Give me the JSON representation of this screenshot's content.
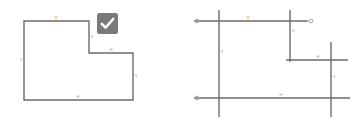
{
  "canvas": {
    "width": 361,
    "height": 124,
    "background": "#ffffff"
  },
  "colors": {
    "stroke": "#6b6b6b",
    "label_text": "#9a9a9a",
    "badge_correct_bg": "#7a7a7a",
    "badge_incorrect_bg": "#7a7a7a",
    "badge_glyph": "#ffffff",
    "endpoint_marker": "#a8a8a8"
  },
  "panels": [
    {
      "id": "correct",
      "name": "closed-polygon-example",
      "badge": {
        "icon": "check-icon",
        "label": "Correct",
        "background": "#7a7a7a"
      },
      "shape": {
        "type": "closed-polygon",
        "sides": 6,
        "points": "24,21 89,21 89,53 133,53 133,100 24,100",
        "edges": [
          {
            "id": "top",
            "label": "H",
            "orientation": "horizontal",
            "label_x": 56,
            "label_y": 19
          },
          {
            "id": "right-upper",
            "label": "V",
            "orientation": "vertical",
            "label_x": 92,
            "label_y": 38
          },
          {
            "id": "middle",
            "label": "H",
            "orientation": "horizontal",
            "label_x": 111,
            "label_y": 51
          },
          {
            "id": "right-lower",
            "label": "V",
            "orientation": "vertical",
            "label_x": 136,
            "label_y": 77
          },
          {
            "id": "bottom",
            "label": "H",
            "orientation": "horizontal",
            "label_x": 78,
            "label_y": 98
          },
          {
            "id": "left",
            "label": "V",
            "orientation": "vertical",
            "label_x": 21,
            "label_y": 61
          }
        ]
      }
    },
    {
      "id": "incorrect",
      "name": "open-overshooting-segments-example",
      "badge": {
        "icon": "cross-icon",
        "label": "Incorrect",
        "background": "#7a7a7a"
      },
      "shape": {
        "type": "open-segments",
        "segments": [
          {
            "id": "top",
            "orientation": "horizontal",
            "x1": 14,
            "y1": 21,
            "x2": 128,
            "y2": 21,
            "label": "H",
            "label_x": 68,
            "label_y": 19
          },
          {
            "id": "left",
            "orientation": "vertical",
            "x1": 39,
            "y1": 10,
            "x2": 39,
            "y2": 117,
            "label": "V",
            "label_x": 42,
            "label_y": 53
          },
          {
            "id": "right-upper",
            "orientation": "vertical",
            "x1": 110,
            "y1": 10,
            "x2": 110,
            "y2": 62,
            "label": "V",
            "label_x": 113,
            "label_y": 32
          },
          {
            "id": "middle",
            "orientation": "horizontal",
            "x1": 106,
            "y1": 60,
            "x2": 168,
            "y2": 60,
            "label": "H",
            "label_x": 138,
            "label_y": 58
          },
          {
            "id": "right-lower",
            "orientation": "vertical",
            "x1": 151,
            "y1": 42,
            "x2": 151,
            "y2": 117,
            "label": "V",
            "label_x": 154,
            "label_y": 78
          },
          {
            "id": "bottom",
            "orientation": "horizontal",
            "x1": 14,
            "y1": 98,
            "x2": 170,
            "y2": 98,
            "label": "H",
            "label_x": 101,
            "label_y": 96
          }
        ],
        "endpoint_markers": [
          {
            "id": "top-left",
            "x": 17,
            "y": 21
          },
          {
            "id": "top-right",
            "x": 131,
            "y": 21
          },
          {
            "id": "bottom-left",
            "x": 17,
            "y": 98
          }
        ]
      }
    }
  ],
  "edge_label_legend": {
    "horizontal": "H",
    "vertical": "V"
  }
}
